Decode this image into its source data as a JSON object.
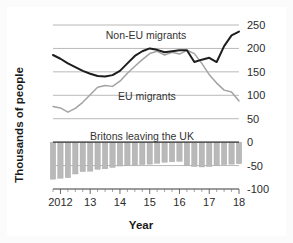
{
  "chart_data": {
    "type": "line",
    "title": "",
    "xlabel": "Year",
    "ylabel": "Thousands of people",
    "ylim": [
      -100,
      250
    ],
    "yticks": [
      250,
      200,
      150,
      100,
      50,
      0,
      -50,
      -100
    ],
    "ytick_labels": [
      "250",
      "200",
      "150",
      "100",
      "50",
      "0",
      "-50",
      "-100"
    ],
    "xlim": [
      2011.75,
      2018.0
    ],
    "xticks": [
      2012,
      2013,
      2014,
      2015,
      2016,
      2017,
      2018
    ],
    "xtick_labels": [
      "2012",
      "13",
      "14",
      "15",
      "16",
      "17",
      "18"
    ],
    "minor_ticks": "quarterly",
    "grid": "horizontal",
    "legend_position": "inline-annotations",
    "x": [
      2011.75,
      2012.0,
      2012.25,
      2012.5,
      2012.75,
      2013.0,
      2013.25,
      2013.5,
      2013.75,
      2014.0,
      2014.25,
      2014.5,
      2014.75,
      2015.0,
      2015.25,
      2015.5,
      2015.75,
      2016.0,
      2016.25,
      2016.5,
      2016.75,
      2017.0,
      2017.25,
      2017.5,
      2017.75,
      2018.0
    ],
    "series": [
      {
        "name": "Non-EU migrants",
        "type": "line",
        "color": "#1d1d1d",
        "label_position": "upper-center",
        "values": [
          186,
          178,
          168,
          160,
          152,
          146,
          141,
          140,
          143,
          152,
          168,
          184,
          194,
          200,
          197,
          192,
          194,
          196,
          196,
          171,
          176,
          180,
          171,
          205,
          228,
          236
        ]
      },
      {
        "name": "EU migrants",
        "type": "line",
        "color": "#a3a3a3",
        "label_position": "middle-center",
        "values": [
          76,
          73,
          64,
          72,
          85,
          101,
          117,
          121,
          119,
          130,
          147,
          162,
          176,
          189,
          194,
          186,
          192,
          188,
          196,
          189,
          168,
          144,
          126,
          111,
          107,
          88
        ]
      },
      {
        "name": "Britons leaving the UK",
        "type": "bar",
        "color": "#b9b9b9",
        "label_position": "bar-area-center",
        "values": [
          -79,
          -77,
          -76,
          -68,
          -63,
          -62,
          -58,
          -57,
          -54,
          -51,
          -50,
          -49,
          -48,
          -47,
          -45,
          -43,
          -42,
          -41,
          -50,
          -52,
          -53,
          -52,
          -50,
          -48,
          -47,
          -46
        ]
      }
    ]
  },
  "labels": {
    "noneu": "Non-EU migrants",
    "eu": "EU migrants",
    "britons": "Britons leaving the UK",
    "xaxis": "Year",
    "yaxis": "Thousands of people"
  }
}
